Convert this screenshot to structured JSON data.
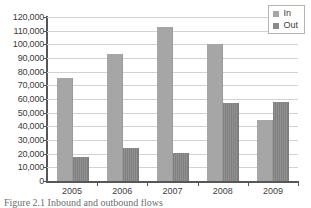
{
  "chart_data": {
    "type": "bar",
    "title": "",
    "xlabel": "",
    "ylabel": "",
    "categories": [
      "2005",
      "2006",
      "2007",
      "2008",
      "2009"
    ],
    "series": [
      {
        "name": "In",
        "color": "#a6a6a6",
        "values": [
          75500,
          93000,
          113000,
          100000,
          45000
        ]
      },
      {
        "name": "Out",
        "color": "#8a8a8a",
        "values": [
          17500,
          24000,
          20500,
          57000,
          57500
        ]
      }
    ],
    "ylim": [
      0,
      120000
    ],
    "ytick_step": 10000,
    "ytick_labels": [
      "120,000",
      "110,000",
      "100,000",
      "90,000",
      "80,000",
      "70,000",
      "60,000",
      "50,000",
      "40,000",
      "30,000",
      "20,000",
      "10,000",
      "0"
    ],
    "ytick_values": [
      120000,
      110000,
      100000,
      90000,
      80000,
      70000,
      60000,
      50000,
      40000,
      30000,
      20000,
      10000,
      0
    ],
    "grid": true,
    "grid_axis": "y",
    "legend_position": "top-right"
  },
  "legend": {
    "items": [
      {
        "label": "In",
        "swatch": "legend-swatch-in"
      },
      {
        "label": "Out",
        "swatch": "legend-swatch-out"
      }
    ]
  },
  "caption": {
    "text": "Figure 2.1 Inbound and outbound flows"
  }
}
